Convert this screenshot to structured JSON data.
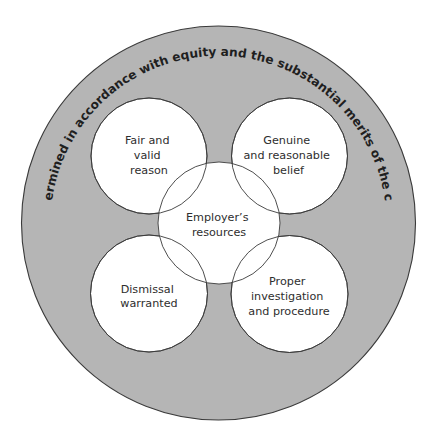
{
  "diagram": {
    "title_arc": "Determined in accordance with equity and the substantial merits of the case",
    "colors": {
      "outer_fill": "#b5b5b5",
      "node_fill": "#ffffff",
      "stroke": "#3a3a3a",
      "text": "#2e2e2e"
    },
    "nodes": [
      {
        "id": "top-left",
        "lines": [
          "Fair and",
          "valid",
          "reason"
        ]
      },
      {
        "id": "top-right",
        "lines": [
          "Genuine",
          "and reasonable",
          "belief"
        ]
      },
      {
        "id": "center",
        "lines": [
          "Employer’s",
          "resources"
        ]
      },
      {
        "id": "bottom-left",
        "lines": [
          "Dismissal",
          "warranted"
        ]
      },
      {
        "id": "bottom-right",
        "lines": [
          "Proper",
          "investigation",
          "and procedure"
        ]
      }
    ]
  }
}
